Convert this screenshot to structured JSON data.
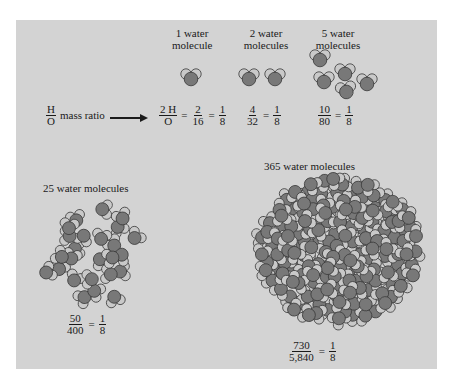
{
  "colors": {
    "panel": "#d3d3d3",
    "oxygen": "#787878",
    "hydrogen": "#c9c9c9",
    "outline": "#3a3a3a"
  },
  "headers": {
    "one": {
      "line1": "1 water",
      "line2": "molecule"
    },
    "two": {
      "line1": "2 water",
      "line2": "molecules"
    },
    "five": {
      "line1": "5 water",
      "line2": "molecules"
    },
    "twentyfive": "25 water molecules",
    "threesixtyfive": "365 water molecules"
  },
  "ratio_row": {
    "lead": {
      "num": "H",
      "den": "O",
      "text": "mass ratio"
    },
    "one": {
      "a_num": "2 H",
      "a_den": "O",
      "b_num": "2",
      "b_den": "16",
      "c_num": "1",
      "c_den": "8"
    },
    "two": {
      "a_num": "4",
      "a_den": "32",
      "c_num": "1",
      "c_den": "8"
    },
    "five": {
      "a_num": "10",
      "a_den": "80",
      "c_num": "1",
      "c_den": "8"
    }
  },
  "twentyfive_ratio": {
    "a_num": "50",
    "a_den": "400",
    "c_num": "1",
    "c_den": "8"
  },
  "threesixtyfive_ratio": {
    "a_num": "730",
    "a_den": "5,840",
    "c_num": "1",
    "c_den": "8"
  },
  "molecules": {
    "one": [
      [
        191,
        77,
        0
      ]
    ],
    "two": [
      [
        249,
        77,
        0
      ],
      [
        275,
        77,
        0
      ]
    ],
    "five": [
      [
        320,
        58,
        0
      ],
      [
        345,
        72,
        0
      ],
      [
        324,
        80,
        0
      ],
      [
        346,
        90,
        -10
      ],
      [
        367,
        82,
        0
      ]
    ]
  },
  "clusters": {
    "twentyfive": {
      "cx": 92,
      "cy": 255,
      "rx": 48,
      "ry": 50,
      "count": 25,
      "seed": 7
    },
    "threesixtyfive": {
      "cx": 338,
      "cy": 250,
      "rx": 80,
      "ry": 70,
      "count": 150,
      "seed": 3
    }
  }
}
